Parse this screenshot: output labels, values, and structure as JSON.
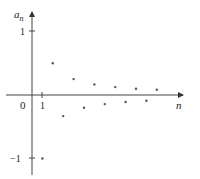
{
  "chart_data": {
    "type": "scatter",
    "title": "",
    "xlabel": "n",
    "ylabel": "a_n",
    "ylabel_display": "a",
    "ylabel_sub": "n",
    "origin_label": "0",
    "x_tick_labels": [
      "1"
    ],
    "y_tick_labels": [
      "1",
      "−1"
    ],
    "yticks": [
      1,
      -1
    ],
    "xticks": [
      1
    ],
    "xlim": [
      0,
      14
    ],
    "ylim": [
      -1.1,
      1.2
    ],
    "grid": false,
    "legend": null,
    "x": [
      1,
      2,
      3,
      4,
      5,
      6,
      7,
      8,
      9,
      10,
      11,
      12
    ],
    "values": [
      -1,
      0.5,
      -0.333,
      0.25,
      -0.2,
      0.167,
      -0.143,
      0.125,
      -0.111,
      0.1,
      -0.091,
      0.083
    ]
  },
  "style": {
    "axis_color": "#444444",
    "point_color": "#555555"
  }
}
